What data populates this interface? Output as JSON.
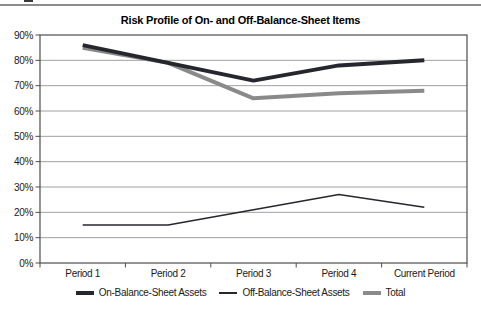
{
  "page": {
    "background": "#ffffff",
    "top_rule_color": "#8c8c8c"
  },
  "colors": {
    "grid": "#a0a0a0",
    "frame": "#4d4d4d",
    "tick": "#4d4d4d",
    "text": "#1a1a1a",
    "title": "#000000"
  },
  "chart_data": {
    "type": "line",
    "title": "Risk Profile of On- and Off-Balance-Sheet Items",
    "categories": [
      "Period 1",
      "Period 2",
      "Period 3",
      "Period 4",
      "Current Period"
    ],
    "series": [
      {
        "name": "On-Balance-Sheet Assets",
        "values": [
          86,
          79,
          72,
          78,
          80
        ],
        "color": "#26262e",
        "width": 4
      },
      {
        "name": "Off-Balance-Sheet Assets",
        "values": [
          15,
          15,
          21,
          27,
          22
        ],
        "color": "#26262e",
        "width": 1.5
      },
      {
        "name": "Total",
        "values": [
          85,
          79,
          65,
          67,
          68
        ],
        "color": "#8a8a8a",
        "width": 4
      }
    ],
    "xlabel": "",
    "ylabel": "",
    "ylim": [
      0,
      90
    ],
    "ytick_step": 10,
    "ytick_suffix": "%",
    "grid": "horizontal",
    "legend_position": "bottom"
  }
}
